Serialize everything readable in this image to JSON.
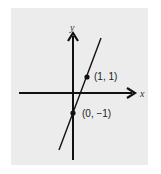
{
  "diagram": {
    "type": "coordinate-plane-line",
    "axes": {
      "x_label": "x",
      "y_label": "y"
    },
    "points": [
      {
        "label": "(1, 1)",
        "x": 1,
        "y": 1
      },
      {
        "label": "(0, −1)",
        "x": 0,
        "y": -1
      }
    ],
    "line": {
      "slope": 2,
      "intercept": -1
    },
    "colors": {
      "background": "#ececec",
      "ink": "#111111"
    }
  }
}
